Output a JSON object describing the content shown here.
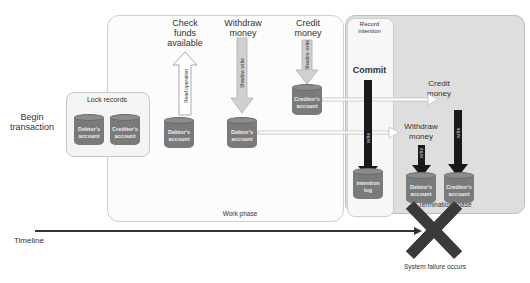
{
  "labels": {
    "begin_transaction": "Begin\ntransaction",
    "lock_records": "Lock records",
    "check_funds": "Check\nfunds\navailable",
    "withdraw_money": "Withdraw\nmoney",
    "credit_money": "Credit\nmoney",
    "record_intention": "Record\nintention",
    "commit": "Commit",
    "work_phase": "Work phase",
    "termination_phase": "Termination phase",
    "timeline": "Timeline",
    "system_failure": "System failure occurs",
    "withdraw_money_term": "Withdraw\nmoney",
    "credit_money_term": "Credit\nmoney"
  },
  "arrow_labels": {
    "read_operation": "Read operation",
    "shadow_write_withdraw": "Shadow write",
    "shadow_write_credit": "Shadow write",
    "write_commit": "write",
    "write_withdraw": "write",
    "write_credit": "write"
  },
  "databases": {
    "lock_debtor": "Debtor's\naccount",
    "lock_creditor": "Creditor's\naccount",
    "check_debtor": "Debtor's\naccount",
    "withdraw_debtor": "Debtor's\naccount",
    "credit_creditor": "Creditor's\naccount",
    "intention_log": "intention\nlog",
    "term_debtor": "Debtor's\naccount",
    "term_creditor": "Creditor's\naccount"
  },
  "colors": {
    "db_fill": "#7a7a7a",
    "arrow_dark": "#1a1a1a",
    "failure_x": "#3a3a3a",
    "term_bg": "#dedede"
  }
}
